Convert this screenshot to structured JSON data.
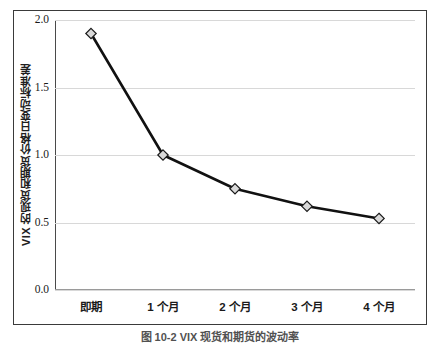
{
  "chart_data": {
    "type": "line",
    "title": "",
    "subtitle": "",
    "xlabel": "",
    "ylabel": "VIX 的现货和期货价格日变动标准差",
    "categories": [
      "即期",
      "1 个月",
      "2 个月",
      "3 个月",
      "4 个月"
    ],
    "values": [
      1.9,
      1.0,
      0.75,
      0.62,
      0.53
    ],
    "series": [
      {
        "name": "VIX 现货和期货价格日变动标准差",
        "values": [
          1.9,
          1.0,
          0.75,
          0.62,
          0.53
        ]
      }
    ],
    "ylim": [
      0.0,
      2.0
    ],
    "yticks": [
      0.0,
      0.5,
      1.0,
      1.5,
      2.0
    ],
    "ytick_labels": [
      "0.0",
      "0.5",
      "1.0",
      "1.5",
      "2.0"
    ],
    "grid": true,
    "grid_axis": "y",
    "legend": false,
    "legend_position": "none",
    "marker": "diamond",
    "marker_fill": "#d9d9d9",
    "marker_edge": "#1a1a1a",
    "line_color": "#111111",
    "line_width": 2.6,
    "grid_color": "#d8d8d8",
    "frame_color": "#3a3a3a",
    "background": "#ffffff"
  },
  "caption": {
    "text": "图 10-2    VIX 现货和期货的波动率"
  }
}
